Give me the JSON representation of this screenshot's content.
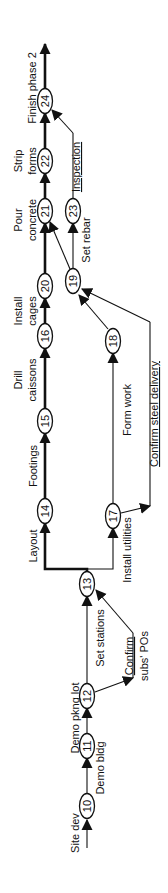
{
  "diagram": {
    "type": "activity-on-arrow network (rotated 90° counter-clockwise)",
    "nodes": [
      {
        "id": "10",
        "label": "10"
      },
      {
        "id": "11",
        "label": "11"
      },
      {
        "id": "12",
        "label": "12"
      },
      {
        "id": "13",
        "label": "13"
      },
      {
        "id": "14",
        "label": "14"
      },
      {
        "id": "15",
        "label": "15"
      },
      {
        "id": "16",
        "label": "16"
      },
      {
        "id": "17",
        "label": "17"
      },
      {
        "id": "18",
        "label": "18"
      },
      {
        "id": "19",
        "label": "19"
      },
      {
        "id": "20",
        "label": "20"
      },
      {
        "id": "21",
        "label": "21"
      },
      {
        "id": "22",
        "label": "22"
      },
      {
        "id": "23",
        "label": "23"
      },
      {
        "id": "24",
        "label": "24"
      }
    ],
    "activities": {
      "site_dev": "Site dev",
      "demo_bldg": "Demo bldg",
      "demo_pkng_lot": "Demo pkng lot",
      "set_stations": "Set stations",
      "confirm_subs_pos_1": "Confirm",
      "confirm_subs_pos_2": "subs' POs",
      "layout": "Layout",
      "install_utilities": "Install utilities",
      "footings": "Footings",
      "drill_caissons_1": "Drill",
      "drill_caissons_2": "caissons",
      "form_work": "Form work",
      "confirm_steel_delivery": "Confirm steel delivery",
      "install_cages_1": "Install",
      "install_cages_2": "cages",
      "set_rebar": "Set rebar",
      "pour_concrete_1": "Pour",
      "pour_concrete_2": "concrete",
      "inspection": "Inspection",
      "strip_forms_1": "Strip",
      "strip_forms_2": "forms",
      "finish_phase_2": "Finish phase 2"
    },
    "edges": [
      {
        "from": "start",
        "to": "10",
        "activity": "Site dev",
        "critical": false
      },
      {
        "from": "10",
        "to": "11",
        "activity": "Demo bldg",
        "critical": false
      },
      {
        "from": "11",
        "to": "12",
        "activity": "Demo pkng lot",
        "critical": false
      },
      {
        "from": "12",
        "to": "13",
        "activity": "Set stations",
        "critical": false
      },
      {
        "from": "12",
        "to": "13",
        "activity": "Confirm subs' POs",
        "critical": false
      },
      {
        "from": "13",
        "to": "14",
        "activity": "Layout",
        "critical": true
      },
      {
        "from": "13",
        "to": "17",
        "activity": "Install utilities",
        "critical": false
      },
      {
        "from": "14",
        "to": "15",
        "activity": "Footings",
        "critical": true
      },
      {
        "from": "15",
        "to": "16",
        "activity": "Drill caissons",
        "critical": true
      },
      {
        "from": "16",
        "to": "20",
        "activity": "Install cages",
        "critical": true
      },
      {
        "from": "17",
        "to": "18",
        "activity": "Form work",
        "critical": false
      },
      {
        "from": "17",
        "to": "19",
        "activity": "Confirm steel delivery",
        "critical": false
      },
      {
        "from": "18",
        "to": "19",
        "activity": "",
        "critical": false
      },
      {
        "from": "19",
        "to": "23",
        "activity": "Set rebar",
        "critical": false
      },
      {
        "from": "19",
        "to": "21",
        "activity": "",
        "critical": false
      },
      {
        "from": "20",
        "to": "21",
        "activity": "",
        "critical": true
      },
      {
        "from": "21",
        "to": "22",
        "activity": "Pour concrete",
        "critical": true
      },
      {
        "from": "23",
        "to": "24",
        "activity": "Inspection",
        "critical": false
      },
      {
        "from": "22",
        "to": "24",
        "activity": "Strip forms",
        "critical": true
      },
      {
        "from": "24",
        "to": "end",
        "activity": "Finish phase 2",
        "critical": true
      }
    ]
  }
}
